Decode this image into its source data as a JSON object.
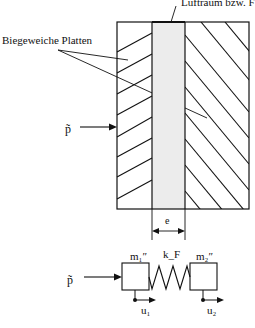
{
  "figure": {
    "labels": {
      "air_gap": "Luftraum bzw. F",
      "plates": "Biegeweiche Platten",
      "pressure_top": "p̃",
      "gap_width": "e",
      "pressure_bottom": "p̃",
      "mass1": "m₁″",
      "mass2": "m₂″",
      "spring": "k_F",
      "disp1": "u₁",
      "disp2": "u₂"
    },
    "colors": {
      "line": "#111111",
      "gap_fill": "#ececec",
      "background": "#ffffff"
    }
  }
}
